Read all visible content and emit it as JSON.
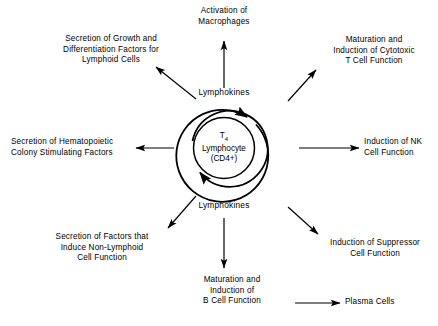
{
  "diagram": {
    "core": {
      "line1_prefix": "T",
      "line1_subscript": "4",
      "line2": "Lymphocyte",
      "line3": "(CD4+)"
    },
    "mediator_top": "Lymphokines",
    "mediator_bottom": "Lymphokines",
    "outputs": [
      {
        "id": "activation-of-macrophages",
        "text": "Activation of\nMacrophages",
        "direction": "up"
      },
      {
        "id": "secretion-of-growth-and-differentiation-factors",
        "text": "Secretion of Growth and\nDifferentiation Factors for\nLymphoid Cells",
        "direction": "up-left"
      },
      {
        "id": "maturation-induction-cytotoxic-t-cell",
        "text": "Maturation and\nInduction of Cytotoxic\nT Cell Function",
        "direction": "up-right"
      },
      {
        "id": "secretion-of-hematopoietic-colony-stimulating-factors",
        "text": "Secretion of Hematopoietic\nColony Stimulating Factors",
        "direction": "left"
      },
      {
        "id": "induction-of-nk-cell-function",
        "text": "Induction of NK\nCell Function",
        "direction": "right"
      },
      {
        "id": "secretion-of-factors-non-lymphoid",
        "text": "Secretion of Factors that\nInduce Non-Lymphoid\nCell Function",
        "direction": "down-left"
      },
      {
        "id": "induction-of-suppressor-cell-function",
        "text": "Induction of Suppressor\nCell Function",
        "direction": "down-right"
      },
      {
        "id": "maturation-induction-b-cell",
        "text": "Maturation and\nInduction of\nB Cell Function",
        "direction": "down"
      },
      {
        "id": "plasma-cells",
        "text": "Plasma Cells",
        "direction": "right-terminal"
      }
    ],
    "colors": {
      "stroke": "#000000",
      "background": "#ffffff",
      "text": "#000000"
    }
  }
}
